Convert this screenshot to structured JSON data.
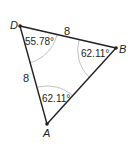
{
  "diagram": {
    "type": "triangle",
    "vertices": [
      {
        "name": "D",
        "x": 20,
        "y": 26
      },
      {
        "name": "B",
        "x": 116,
        "y": 48
      },
      {
        "name": "A",
        "x": 47,
        "y": 124
      }
    ],
    "sides": [
      {
        "from": "D",
        "to": "B",
        "length_label": "8"
      },
      {
        "from": "D",
        "to": "A",
        "length_label": "8"
      },
      {
        "from": "B",
        "to": "A",
        "length_label": ""
      }
    ],
    "angles": [
      {
        "vertex": "D",
        "label": "55.78°"
      },
      {
        "vertex": "B",
        "label": "62.11°"
      },
      {
        "vertex": "A",
        "label": "62.11°"
      }
    ],
    "colors": {
      "line": "#231f20",
      "arc": "#b0b0b0"
    }
  },
  "labels": {
    "vertex_d": "D",
    "vertex_b": "B",
    "vertex_a": "A",
    "side_db": "8",
    "side_da": "8",
    "angle_d": "55.78°",
    "angle_b": "62.11°",
    "angle_a": "62.11°"
  }
}
